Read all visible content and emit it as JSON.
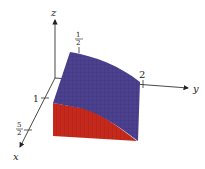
{
  "figure": {
    "type": "3d-solid-plot",
    "axes": {
      "x": {
        "label": "x",
        "ticks": [
          {
            "label": "1"
          },
          {
            "label_num": "5",
            "label_den": "2"
          }
        ]
      },
      "y": {
        "label": "y",
        "ticks": [
          {
            "label": "2"
          }
        ]
      },
      "z": {
        "label": "z",
        "ticks": [
          {
            "label_num": "1",
            "label_den": "2"
          }
        ]
      }
    },
    "surfaces": {
      "top": {
        "name": "top surface",
        "color": "#4a3f8c"
      },
      "side": {
        "name": "front side face",
        "color": "#c0281c"
      }
    }
  }
}
